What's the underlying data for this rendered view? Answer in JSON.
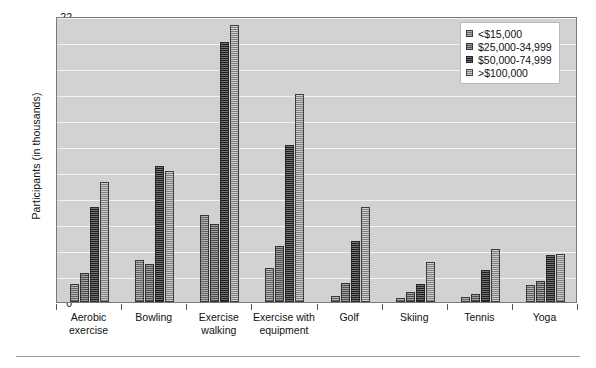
{
  "chart_data": {
    "type": "bar",
    "title": "",
    "xlabel": "",
    "ylabel": "Participants (in thousands)",
    "ylim": [
      0,
      22
    ],
    "yticks": [
      0,
      2,
      4,
      6,
      8,
      10,
      12,
      14,
      16,
      18,
      20,
      22
    ],
    "grid": true,
    "legend_position": "top-right",
    "categories": [
      "Aerobic exercise",
      "Bowling",
      "Exercise walking",
      "Exercise with equipment",
      "Golf",
      "Skiing",
      "Tennis",
      "Yoga"
    ],
    "series": [
      {
        "name": "<$15,000",
        "color": "#8d8d8d",
        "values": [
          1.4,
          3.2,
          6.7,
          2.6,
          0.5,
          0.3,
          0.4,
          1.3
        ]
      },
      {
        "name": "$25,000-34,999",
        "color": "#6f6f6f",
        "values": [
          2.2,
          2.9,
          6.0,
          4.3,
          1.5,
          0.8,
          0.6,
          1.6
        ]
      },
      {
        "name": "$50,000-74,999",
        "color": "#2b2b2b",
        "values": [
          7.3,
          10.5,
          20.0,
          12.1,
          4.7,
          1.4,
          2.5,
          3.6
        ]
      },
      {
        "name": ">$100,000",
        "color": "#b4b4b4",
        "values": [
          9.2,
          10.1,
          21.3,
          16.0,
          7.3,
          3.1,
          4.1,
          3.7
        ]
      }
    ]
  },
  "colors": {
    "plot_background": "#d2d2d2",
    "gridline": "#f2f2f2",
    "axis": "#7a7a7a",
    "page_background": "#ffffff"
  }
}
